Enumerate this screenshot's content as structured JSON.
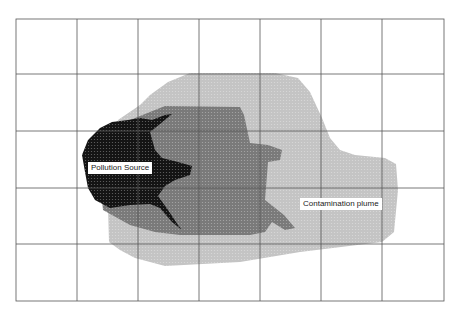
{
  "diagram": {
    "type": "contamination-map",
    "grid": {
      "columns": 7,
      "rows": 5,
      "x_lines": [
        16,
        77,
        138,
        199,
        260,
        321,
        382,
        444
      ],
      "y_lines": [
        19,
        74,
        131,
        188,
        244,
        301
      ],
      "line_color": "#555555"
    },
    "zones": [
      {
        "name": "contamination-plume-outer",
        "color": "#c4c4c4"
      },
      {
        "name": "contamination-plume-inner",
        "color": "#7c7c7c"
      },
      {
        "name": "pollution-source",
        "color": "#111111"
      }
    ],
    "labels": {
      "pollution_source": "Pollution Source",
      "contamination_plume": "Contamination plume"
    }
  }
}
